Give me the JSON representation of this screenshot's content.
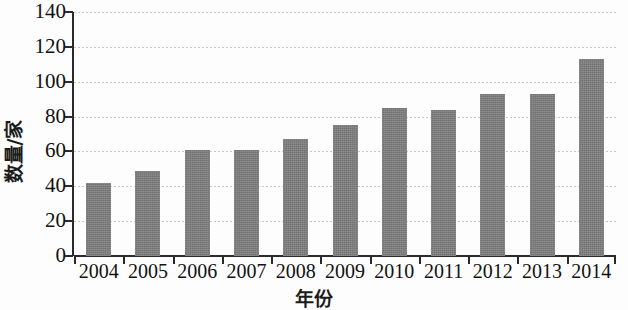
{
  "chart_data": {
    "type": "bar",
    "title": "",
    "subtitle": "",
    "xlabel": "年份",
    "ylabel": "数量/家",
    "categories": [
      "2004",
      "2005",
      "2006",
      "2007",
      "2008",
      "2009",
      "2010",
      "2011",
      "2012",
      "2013",
      "2014"
    ],
    "values": [
      42,
      49,
      61,
      61,
      67,
      75,
      85,
      84,
      93,
      93,
      113
    ],
    "ylim": [
      0,
      140
    ],
    "ytick_step": 20,
    "yticks": [
      "0",
      "20",
      "40",
      "60",
      "80",
      "100",
      "120",
      "140"
    ],
    "grid": true,
    "grid_axis": "y",
    "legend": null,
    "legend_position": "none",
    "bar_color": "#7e7e7e",
    "axis_color": "#2a2a2a",
    "gridline_color": "#c9c9c9",
    "background_color": "#fdfdfd"
  }
}
